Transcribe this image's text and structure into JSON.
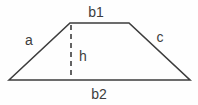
{
  "diagram": {
    "type": "trapezoid-geometry-figure",
    "labels": {
      "top_base": "b1",
      "left_side": "a",
      "right_side": "c",
      "height": "h",
      "bottom_base": "b2"
    },
    "colors": {
      "line": "#3d3d3d",
      "text": "#3d3d3d",
      "background": "#fefefe"
    }
  }
}
